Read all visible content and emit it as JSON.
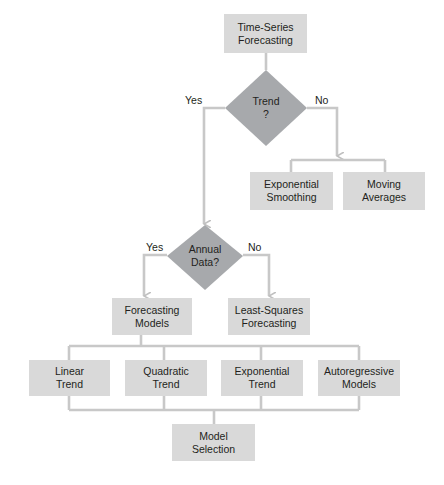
{
  "diagram": {
    "type": "flowchart",
    "nodes": {
      "start": {
        "label": "Time-Series\nForecasting",
        "shape": "rectangle"
      },
      "trend_decision": {
        "label": "Trend\n?",
        "shape": "diamond"
      },
      "exponential_smoothing": {
        "label": "Exponential\nSmoothing",
        "shape": "rectangle"
      },
      "moving_averages": {
        "label": "Moving\nAverages",
        "shape": "rectangle"
      },
      "annual_decision": {
        "label": "Annual\nData?",
        "shape": "diamond"
      },
      "forecasting_models": {
        "label": "Forecasting\nModels",
        "shape": "rectangle"
      },
      "least_squares": {
        "label": "Least-Squares\nForecasting",
        "shape": "rectangle"
      },
      "linear_trend": {
        "label": "Linear\nTrend",
        "shape": "rectangle"
      },
      "quadratic_trend": {
        "label": "Quadratic\nTrend",
        "shape": "rectangle"
      },
      "exponential_trend": {
        "label": "Exponential\nTrend",
        "shape": "rectangle"
      },
      "autoregressive": {
        "label": "Autoregressive\nModels",
        "shape": "rectangle"
      },
      "model_selection": {
        "label": "Model\nSelection",
        "shape": "rectangle"
      }
    },
    "edge_labels": {
      "trend_yes": "Yes",
      "trend_no": "No",
      "annual_yes": "Yes",
      "annual_no": "No"
    },
    "edges": [
      {
        "from": "start",
        "to": "trend_decision"
      },
      {
        "from": "trend_decision",
        "to": "annual_decision",
        "label": "Yes"
      },
      {
        "from": "trend_decision",
        "to": "exponential_smoothing",
        "label": "No"
      },
      {
        "from": "trend_decision",
        "to": "moving_averages",
        "label": "No"
      },
      {
        "from": "annual_decision",
        "to": "forecasting_models",
        "label": "Yes"
      },
      {
        "from": "annual_decision",
        "to": "least_squares",
        "label": "No"
      },
      {
        "from": "forecasting_models",
        "to": "linear_trend"
      },
      {
        "from": "forecasting_models",
        "to": "quadratic_trend"
      },
      {
        "from": "forecasting_models",
        "to": "exponential_trend"
      },
      {
        "from": "forecasting_models",
        "to": "autoregressive"
      },
      {
        "from": "linear_trend",
        "to": "model_selection"
      },
      {
        "from": "quadratic_trend",
        "to": "model_selection"
      },
      {
        "from": "exponential_trend",
        "to": "model_selection"
      },
      {
        "from": "autoregressive",
        "to": "model_selection"
      }
    ],
    "colors": {
      "box_fill": "#d9d9d9",
      "diamond_fill": "#a7a9ac",
      "connector": "#c8c8c8",
      "text": "#231f20"
    }
  }
}
